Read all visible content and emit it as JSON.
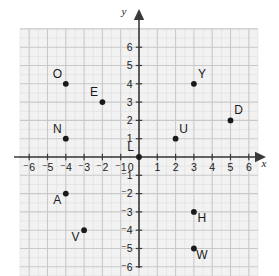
{
  "figure": {
    "type": "coordinate-plane",
    "title": "",
    "background_color": "#ffffff",
    "grid_fill": "#f2f2f2",
    "grid_minor_color": "#e2e2e2",
    "grid_major_color": "#c9c9c9",
    "axis_color": "#3a3a3a",
    "point_color": "#1a1a1a",
    "label_color": "#1a1a1a"
  },
  "axes": {
    "x_label": "x",
    "y_label": "y",
    "origin_label": "0",
    "x_ticks": [
      "⁻6",
      "⁻5",
      "⁻4",
      "⁻3",
      "⁻2",
      "⁻1",
      "1",
      "2",
      "3",
      "4",
      "5",
      "6"
    ],
    "y_ticks": [
      "6",
      "5",
      "4",
      "3",
      "2",
      "1",
      "⁻1",
      "⁻2",
      "⁻3",
      "⁻4",
      "⁻5",
      "⁻6"
    ],
    "x_range": [
      -6.5,
      6.5
    ],
    "y_range": [
      -6.5,
      7.0
    ],
    "x_tick_values": [
      -6,
      -5,
      -4,
      -3,
      -2,
      -1,
      1,
      2,
      3,
      4,
      5,
      6
    ],
    "y_tick_values": [
      6,
      5,
      4,
      3,
      2,
      1,
      -1,
      -2,
      -3,
      -4,
      -5,
      -6
    ]
  },
  "chart_data": {
    "type": "scatter",
    "title": "",
    "xlabel": "x",
    "ylabel": "y",
    "xlim": [
      -6.5,
      6.5
    ],
    "ylim": [
      -6.5,
      7.0
    ],
    "grid": true,
    "legend": "none",
    "points": [
      {
        "label": "O",
        "x": -4,
        "y": 4,
        "label_pos": "upper-left"
      },
      {
        "label": "E",
        "x": -2,
        "y": 3,
        "label_pos": "upper-left"
      },
      {
        "label": "N",
        "x": -4,
        "y": 1,
        "label_pos": "upper-left"
      },
      {
        "label": "L",
        "x": 0,
        "y": 0,
        "label_pos": "upper-left"
      },
      {
        "label": "U",
        "x": 2,
        "y": 1,
        "label_pos": "upper-right"
      },
      {
        "label": "Y",
        "x": 3,
        "y": 4,
        "label_pos": "upper-right"
      },
      {
        "label": "D",
        "x": 5,
        "y": 2,
        "label_pos": "upper-right"
      },
      {
        "label": "A",
        "x": -4,
        "y": -2,
        "label_pos": "lower-left"
      },
      {
        "label": "V",
        "x": -3,
        "y": -4,
        "label_pos": "lower-left"
      },
      {
        "label": "H",
        "x": 3,
        "y": -3,
        "label_pos": "lower-right"
      },
      {
        "label": "W",
        "x": 3,
        "y": -5,
        "label_pos": "lower-right"
      }
    ]
  }
}
